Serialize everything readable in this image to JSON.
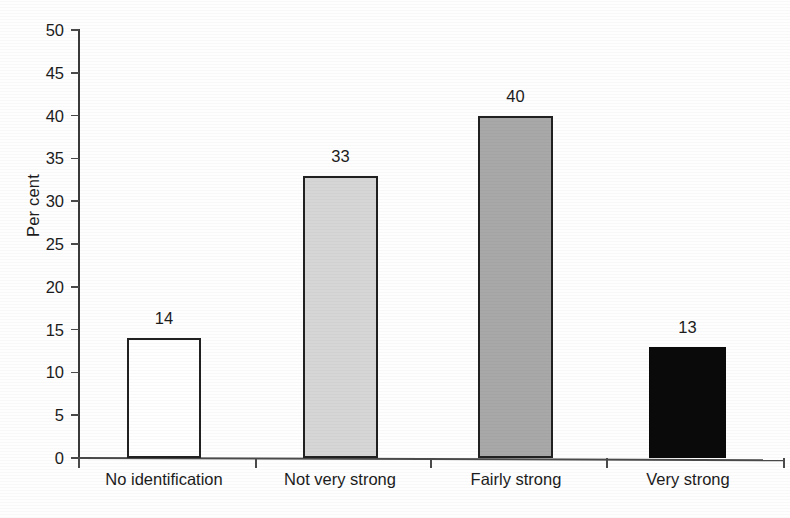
{
  "chart_data": {
    "type": "bar",
    "title": "",
    "xlabel": "",
    "ylabel": "Per cent",
    "categories": [
      "No identification",
      "Not very strong",
      "Fairly strong",
      "Very strong"
    ],
    "values": [
      14,
      33,
      40,
      13
    ],
    "value_labels": [
      "14",
      "33",
      "40",
      "13"
    ],
    "bar_styles": [
      "outlined",
      "lightgray",
      "midgray",
      "black"
    ],
    "bar_colors": [
      "#ffffff",
      "#d6d6d6",
      "#a8a8a8",
      "#0a0a0a"
    ],
    "bar_border_color": "#212121",
    "ylim": [
      0,
      50
    ],
    "ytick_step": 5,
    "ytick_labels": [
      "50",
      "45",
      "40",
      "35",
      "30",
      "25",
      "20",
      "15",
      "10",
      "5",
      "0"
    ],
    "grid": false,
    "legend": "none",
    "axis_color": "#4a4a4a"
  },
  "axes": {
    "y_label": "Per cent"
  },
  "caption": {
    "sliver_text": ""
  }
}
